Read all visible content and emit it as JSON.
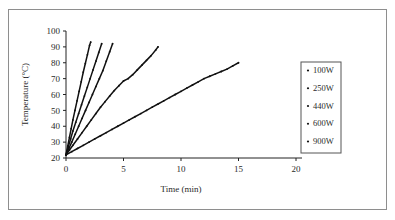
{
  "figure": {
    "background_color": "#ffffff",
    "frame_color": "#8e8e8e",
    "axis_color": "#222222",
    "series_color": "#111111"
  },
  "chart_data": {
    "type": "line",
    "title": "",
    "subtitle": "",
    "xlabel": "Time (min)",
    "ylabel": "Temperature (°C)",
    "xlim": [
      0,
      20
    ],
    "ylim": [
      20,
      100
    ],
    "xticks": [
      0,
      5,
      10,
      15,
      20
    ],
    "yticks": [
      20,
      30,
      40,
      50,
      60,
      70,
      80,
      90,
      100
    ],
    "xtick_labels": [
      "0",
      "5",
      "10",
      "15",
      "20"
    ],
    "ytick_labels": [
      "20",
      "30",
      "40",
      "50",
      "60",
      "70",
      "80",
      "90",
      "100"
    ],
    "grid": false,
    "legend_position": "right-outside",
    "legend_entries": [
      "100W",
      "250W",
      "440W",
      "600W",
      "900W"
    ],
    "marker": "dot",
    "series": [
      {
        "name": "100W",
        "color": "#111111",
        "x": [
          0,
          0.5,
          1,
          1.5,
          2,
          2.5,
          3,
          3.5,
          4,
          4.5,
          5,
          5.5,
          6,
          6.5,
          7,
          7.5,
          8,
          8.5,
          9,
          9.5,
          10,
          10.5,
          11,
          11.5,
          12,
          12.5,
          13,
          13.5,
          14,
          14.5,
          15
        ],
        "y": [
          22,
          24,
          26,
          28,
          30,
          32,
          34,
          36,
          38,
          40,
          42,
          44,
          46,
          48,
          50,
          52,
          54,
          56,
          58,
          60,
          62,
          64,
          66,
          68,
          70,
          71.5,
          73,
          74.5,
          76,
          78,
          80
        ]
      },
      {
        "name": "250W",
        "color": "#111111",
        "x": [
          0,
          0.3,
          0.6,
          1,
          1.4,
          1.8,
          2.2,
          2.6,
          3,
          3.4,
          3.8,
          4.2,
          4.6,
          5,
          5.4,
          5.8,
          6.2,
          6.6,
          7,
          7.4,
          7.8,
          8
        ],
        "y": [
          22,
          25,
          28,
          32,
          36,
          40,
          44,
          48,
          52,
          55.5,
          59,
          62.5,
          65.5,
          68.5,
          70,
          72.5,
          75.5,
          78.5,
          81.5,
          84.5,
          88,
          90
        ]
      },
      {
        "name": "440W",
        "color": "#111111",
        "x": [
          0,
          0.25,
          0.5,
          0.8,
          1.1,
          1.4,
          1.7,
          2,
          2.3,
          2.6,
          2.9,
          3.2,
          3.5,
          3.8,
          4.05
        ],
        "y": [
          22,
          26,
          30,
          35,
          40,
          45,
          50,
          55,
          60,
          65,
          70,
          75,
          81,
          87,
          92
        ]
      },
      {
        "name": "600W",
        "color": "#111111",
        "x": [
          0,
          0.2,
          0.4,
          0.6,
          0.85,
          1.1,
          1.35,
          1.6,
          1.85,
          2.1,
          2.35,
          2.6,
          2.85,
          3.1
        ],
        "y": [
          22,
          27,
          32,
          37,
          42.5,
          48,
          53.5,
          59,
          64.5,
          70,
          75.5,
          81,
          86.5,
          92
        ]
      },
      {
        "name": "900W",
        "color": "#111111",
        "x": [
          0,
          0.15,
          0.3,
          0.45,
          0.6,
          0.78,
          0.96,
          1.14,
          1.32,
          1.5,
          1.68,
          1.86,
          2.05,
          2.15
        ],
        "y": [
          22,
          27.5,
          33,
          38.5,
          44,
          50,
          56,
          62,
          68,
          74,
          79.5,
          85,
          91,
          93
        ]
      }
    ]
  }
}
